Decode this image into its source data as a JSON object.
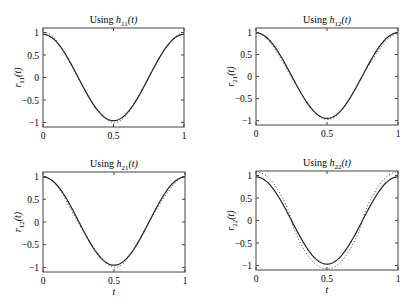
{
  "figure": {
    "width": 413,
    "height": 308,
    "axis_color": "#444444",
    "line_color": "#222222",
    "dotted_color": "#333333"
  },
  "chart_data": [
    {
      "type": "line",
      "title_prefix": "Using ",
      "title_func": "h",
      "title_sub": "11",
      "title_arg": "(t)",
      "ylabel_func": "r",
      "ylabel_sub": "11",
      "ylabel_arg": "(t)",
      "xlabel": "",
      "xlim": [
        0,
        1
      ],
      "ylim": [
        -1.1,
        1.1
      ],
      "xticks": [
        "0",
        "0.5",
        "1"
      ],
      "yticks": [
        "1",
        "0.5",
        "0",
        "-0.5",
        "-1"
      ],
      "grid": false,
      "box": {
        "x": 43,
        "y": 28,
        "w": 141,
        "h": 99
      },
      "series": [
        {
          "name": "exact",
          "style": "solid",
          "amplitude": 0.96,
          "offset": 0.0,
          "formula": "A*cos(2*pi*t)"
        },
        {
          "name": "approximation",
          "style": "dotted",
          "amplitude": 0.98,
          "offset": 0.0,
          "ripple": 0.03,
          "formula": "A*cos(2*pi*t) + ripple"
        }
      ]
    },
    {
      "type": "line",
      "title_prefix": "Using ",
      "title_func": "h",
      "title_sub": "12",
      "title_arg": "(t)",
      "ylabel_func": "r",
      "ylabel_sub": "21",
      "ylabel_arg": "(t)",
      "xlabel": "",
      "xlim": [
        0,
        1
      ],
      "ylim": [
        -1.1,
        1.1
      ],
      "xticks": [
        "0",
        "0.5",
        "1"
      ],
      "yticks": [
        "1",
        "0.5",
        "0",
        "-0.5",
        "-1"
      ],
      "grid": false,
      "box": {
        "x": 256,
        "y": 28,
        "w": 142,
        "h": 97
      },
      "series": [
        {
          "name": "exact",
          "style": "solid",
          "amplitude": 0.97,
          "offset": 0.02,
          "formula": "A*cos(2*pi*t)"
        },
        {
          "name": "approximation",
          "style": "dotted",
          "amplitude": 0.95,
          "offset": 0.0,
          "ripple": 0.03,
          "formula": "A*cos(2*pi*t) + ripple"
        }
      ]
    },
    {
      "type": "line",
      "title_prefix": "Using ",
      "title_func": "h",
      "title_sub": "21",
      "title_arg": "(t)",
      "ylabel_func": "r",
      "ylabel_sub": "12",
      "ylabel_arg": "(t)",
      "xlabel": "t",
      "xlim": [
        0,
        1
      ],
      "ylim": [
        -1.1,
        1.1
      ],
      "xticks": [
        "0",
        "0.5",
        "1"
      ],
      "yticks": [
        "1",
        "0.5",
        "0",
        "-0.5",
        "-1"
      ],
      "grid": false,
      "box": {
        "x": 43,
        "y": 172,
        "w": 142,
        "h": 100
      },
      "series": [
        {
          "name": "exact",
          "style": "solid",
          "amplitude": 0.97,
          "offset": 0.02,
          "formula": "A*cos(2*pi*t)"
        },
        {
          "name": "approximation",
          "style": "dotted",
          "amplitude": 0.96,
          "offset": 0.0,
          "ripple": 0.04,
          "formula": "A*cos(2*pi*t) + ripple"
        }
      ]
    },
    {
      "type": "line",
      "title_prefix": "Using ",
      "title_func": "h",
      "title_sub": "22",
      "title_arg": "(t)",
      "ylabel_func": "r",
      "ylabel_sub": "22",
      "ylabel_arg": "(t)",
      "xlabel": "t",
      "xlim": [
        0,
        1
      ],
      "ylim": [
        -1.1,
        1.1
      ],
      "xticks": [
        "0",
        "0.5",
        "1"
      ],
      "yticks": [
        "1",
        "0.5",
        "0",
        "-0.5",
        "-1"
      ],
      "grid": false,
      "box": {
        "x": 256,
        "y": 171,
        "w": 142,
        "h": 99
      },
      "series": [
        {
          "name": "exact",
          "style": "solid",
          "amplitude": 0.97,
          "offset": 0.0,
          "formula": "A*cos(2*pi*t)"
        },
        {
          "name": "approximation",
          "style": "dotted",
          "amplitude": 1.08,
          "offset": 0.0,
          "ripple": 0.0,
          "formula": "A*cos(2*pi*t)",
          "note": "overshoots ±1 near t=0, 0.5, 1"
        }
      ]
    }
  ]
}
